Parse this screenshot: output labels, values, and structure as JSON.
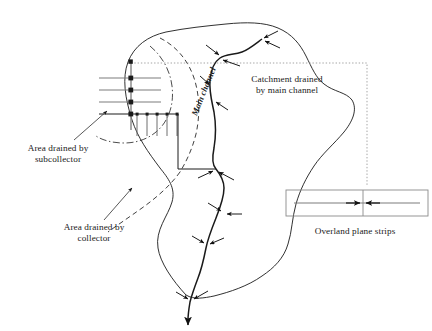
{
  "diagram": {
    "type": "schematic",
    "labels": {
      "subcollector": "Area drained by\nsubcollector",
      "collector": "Area drained by\ncollector",
      "catchment": "Catchment drained\nby main channel",
      "overland": "Overland plane strips",
      "main_channel": "Main channel"
    },
    "colors": {
      "line": "#1a1a1a",
      "grid_gray": "#7d7d7d",
      "box_gray": "#8a8a8a",
      "dotted": "#9a9a9a",
      "background": "#ffffff"
    },
    "elements": {
      "catchment_boundary": "solid irregular closed outline",
      "collector_boundary": "dashed arc",
      "subcollector_boundary": "dash-dot arc",
      "main_channel": "sinuous solid line with tributary junctions and arrowheads",
      "subcollector_grid": "vertical trunk with four horizontal laterals and five downward laterals",
      "connector": "dotted line from subcollector grid to overland plane strips box",
      "overland_strips_box": "rectangle split by a central vertical divider with opposing arrows"
    },
    "counts": {
      "tributary_junctions": 7,
      "horizontal_laterals": 4,
      "downward_laterals": 5,
      "grid_nodes": 5
    }
  }
}
